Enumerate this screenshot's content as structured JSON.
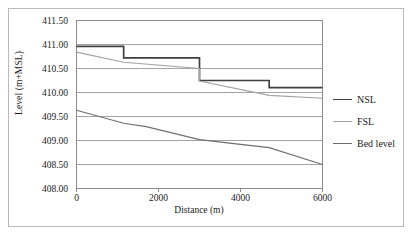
{
  "chart_data": {
    "type": "line",
    "title": "",
    "xlabel": "Distance (m)",
    "ylabel": "Level (m+MSL)",
    "xlim": [
      0,
      6000
    ],
    "ylim": [
      408.0,
      411.5
    ],
    "xticks": [
      "0",
      "2000",
      "4000",
      "6000"
    ],
    "xtick_values": [
      0,
      2000,
      4000,
      6000
    ],
    "yticks": [
      "408.00",
      "408.50",
      "409.00",
      "409.50",
      "410.00",
      "410.50",
      "411.00",
      "411.50"
    ],
    "ytick_values": [
      408.0,
      408.5,
      409.0,
      409.5,
      410.0,
      410.5,
      411.0,
      411.5
    ],
    "grid": "horizontal",
    "legend_position": "right",
    "series": [
      {
        "name": "NSL",
        "color": "#3f3f3f",
        "style": "step",
        "x": [
          0,
          1150,
          1150,
          3000,
          3000,
          4700,
          4700,
          6000
        ],
        "y": [
          410.96,
          410.96,
          410.72,
          410.72,
          410.25,
          410.25,
          410.1,
          410.1
        ]
      },
      {
        "name": "FSL",
        "color": "#a3a3a3",
        "style": "step-sloped",
        "x": [
          0,
          1150,
          1150,
          3000,
          3000,
          4700,
          4700,
          6000
        ],
        "y": [
          410.84,
          410.63,
          410.63,
          410.5,
          410.24,
          409.94,
          409.94,
          409.88
        ]
      },
      {
        "name": "Bed level",
        "color": "#6f6f6f",
        "style": "line",
        "x": [
          0,
          1150,
          1700,
          3000,
          4000,
          4700,
          6000
        ],
        "y": [
          409.63,
          409.36,
          409.29,
          409.02,
          408.92,
          408.85,
          408.5
        ]
      }
    ]
  },
  "legend": {
    "items": [
      {
        "label": "NSL",
        "color": "#3f3f3f"
      },
      {
        "label": "FSL",
        "color": "#a3a3a3"
      },
      {
        "label": "Bed level",
        "color": "#6f6f6f"
      }
    ]
  }
}
